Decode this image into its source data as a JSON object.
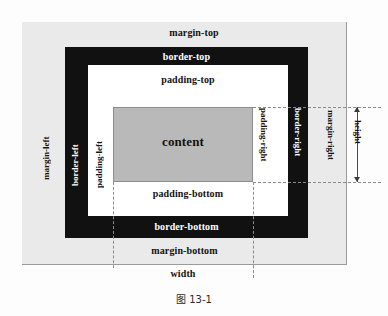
{
  "figure": {
    "caption": "图 13-1"
  },
  "boxes": {
    "margin": {
      "label_top": "margin-top",
      "label_bottom": "margin-bottom",
      "label_left": "margin-left",
      "label_right": "margin-right",
      "color": "#eaeaea"
    },
    "border": {
      "label_top": "border-top",
      "label_bottom": "border-bottom",
      "label_left": "border-left",
      "label_right": "border-right",
      "color": "#111111"
    },
    "padding": {
      "label_top": "padding-top",
      "label_bottom": "padding-bottom",
      "label_left": "padding-left",
      "label_right": "padding-right",
      "color": "#ffffff"
    },
    "content": {
      "label": "content",
      "color": "#b9b9b9"
    }
  },
  "dimensions": {
    "width_label": "width",
    "height_label": "height"
  }
}
